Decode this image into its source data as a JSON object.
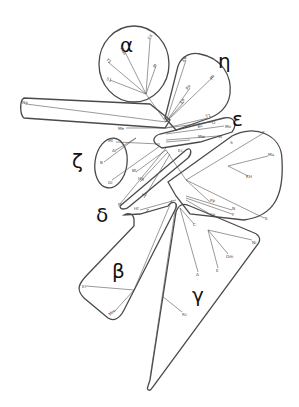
{
  "diagram": {
    "type": "phylogenetic-tree-with-clade-groupings",
    "groups": [
      {
        "id": "alpha",
        "label": "α",
        "x": 128,
        "y": 48,
        "leaves": [
          "Ed",
          "Mas",
          "Y1",
          "M",
          "S1"
        ]
      },
      {
        "id": "eta",
        "label": "η",
        "x": 224,
        "y": 64,
        "leaves": [
          "EB",
          "Pa",
          "Mi",
          "Ep"
        ]
      },
      {
        "id": "epsilon",
        "label": "ε",
        "x": 236,
        "y": 124,
        "leaves": [
          "T1",
          "Bc",
          "O",
          "Mo",
          "Mw",
          "W"
        ]
      },
      {
        "id": "zeta",
        "label": "ζ",
        "x": 76,
        "y": 170,
        "leaves": [
          "Mt",
          "Ar",
          "B",
          "Gl"
        ]
      },
      {
        "id": "delta",
        "label": "δ",
        "x": 96,
        "y": 218,
        "leaves": [
          "Bt",
          "Hg",
          "Lc",
          "Ec",
          "Pr"
        ]
      },
      {
        "id": "beta",
        "label": "β",
        "x": 116,
        "y": 278,
        "leaves": [
          "El",
          "Mm"
        ]
      },
      {
        "id": "gamma",
        "label": "γ",
        "x": 196,
        "y": 300,
        "leaves": [
          "C",
          "A",
          "E",
          "Om",
          "Ni",
          "Rc"
        ]
      }
    ],
    "other_leaves": [
      {
        "label": "Np",
        "x": 24,
        "y": 103
      },
      {
        "label": "Me",
        "x": 120,
        "y": 128
      },
      {
        "label": "K",
        "x": 262,
        "y": 134
      },
      {
        "label": "S",
        "x": 232,
        "y": 142
      },
      {
        "label": "Mu",
        "x": 268,
        "y": 155
      },
      {
        "label": "KH",
        "x": 248,
        "y": 175
      },
      {
        "label": "Pp",
        "x": 210,
        "y": 201
      },
      {
        "label": "N",
        "x": 232,
        "y": 210
      },
      {
        "label": "Sp",
        "x": 210,
        "y": 213
      },
      {
        "label": "F",
        "x": 234,
        "y": 214
      },
      {
        "label": "Tc",
        "x": 266,
        "y": 218
      },
      {
        "label": "Z",
        "x": 146,
        "y": 210
      },
      {
        "label": "Ht",
        "x": 134,
        "y": 208
      }
    ]
  }
}
